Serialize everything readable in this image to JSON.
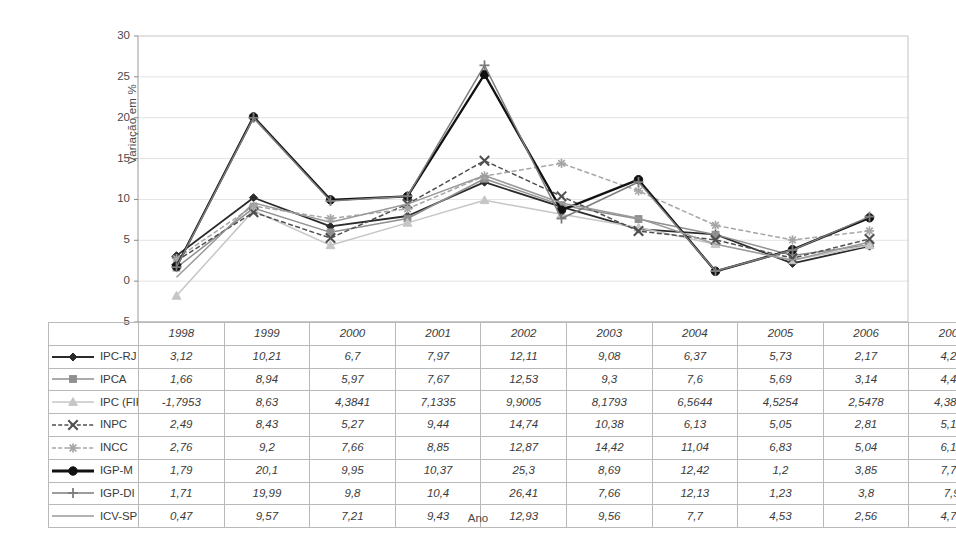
{
  "chart_data": {
    "type": "line",
    "title": "",
    "xlabel": "Ano",
    "ylabel": "Variação em %",
    "categories": [
      "1998",
      "1999",
      "2000",
      "2001",
      "2002",
      "2003",
      "2004",
      "2005",
      "2006",
      "2007"
    ],
    "ylim": [
      -5,
      30
    ],
    "yticks": [
      30,
      25,
      20,
      15,
      10,
      5,
      0,
      -5
    ],
    "grid": true,
    "legend_position": "table-below",
    "series": [
      {
        "name": "IPC-RJ",
        "marker": "diamond",
        "color": "#2b2b2b",
        "dash": "solid",
        "values": [
          3.12,
          10.21,
          6.7,
          7.97,
          12.11,
          9.08,
          6.37,
          5.73,
          2.17,
          4.28
        ],
        "labels": [
          "3,12",
          "10,21",
          "6,7",
          "7,97",
          "12,11",
          "9,08",
          "6,37",
          "5,73",
          "2,17",
          "4,28"
        ]
      },
      {
        "name": "IPCA",
        "marker": "square",
        "color": "#8f8f8f",
        "dash": "solid",
        "values": [
          1.66,
          8.94,
          5.97,
          7.67,
          12.53,
          9.3,
          7.6,
          5.69,
          3.14,
          4.46
        ],
        "labels": [
          "1,66",
          "8,94",
          "5,97",
          "7,67",
          "12,53",
          "9,3",
          "7,6",
          "5,69",
          "3,14",
          "4,46"
        ]
      },
      {
        "name": "IPC (FIPE)",
        "marker": "triangle",
        "color": "#c6c6c6",
        "dash": "solid",
        "values": [
          -1.7953,
          8.63,
          4.3841,
          7.1335,
          9.9005,
          8.1793,
          6.5644,
          4.5254,
          2.5478,
          4.3821
        ],
        "labels": [
          "-1,7953",
          "8,63",
          "4,3841",
          "7,1335",
          "9,9005",
          "8,1793",
          "6,5644",
          "4,5254",
          "2,5478",
          "4,3821"
        ]
      },
      {
        "name": "INPC",
        "marker": "x",
        "color": "#4f4f4f",
        "dash": "dashed",
        "values": [
          2.49,
          8.43,
          5.27,
          9.44,
          14.74,
          10.38,
          6.13,
          5.05,
          2.81,
          5.16
        ],
        "labels": [
          "2,49",
          "8,43",
          "5,27",
          "9,44",
          "14,74",
          "10,38",
          "6,13",
          "5,05",
          "2,81",
          "5,16"
        ]
      },
      {
        "name": "INCC",
        "marker": "star",
        "color": "#a6a6a6",
        "dash": "dashed",
        "values": [
          2.76,
          9.2,
          7.66,
          8.85,
          12.87,
          14.42,
          11.04,
          6.83,
          5.04,
          6.15
        ],
        "labels": [
          "2,76",
          "9,2",
          "7,66",
          "8,85",
          "12,87",
          "14,42",
          "11,04",
          "6,83",
          "5,04",
          "6,15"
        ]
      },
      {
        "name": "IGP-M",
        "marker": "circle",
        "color": "#111111",
        "dash": "solid",
        "values": [
          1.79,
          20.1,
          9.95,
          10.37,
          25.3,
          8.69,
          12.42,
          1.2,
          3.85,
          7.75
        ],
        "labels": [
          "1,79",
          "20,1",
          "9,95",
          "10,37",
          "25,3",
          "8,69",
          "12,42",
          "1,2",
          "3,85",
          "7,75"
        ]
      },
      {
        "name": "IGP-DI",
        "marker": "plus",
        "color": "#7d7d7d",
        "dash": "solid",
        "values": [
          1.71,
          19.99,
          9.8,
          10.4,
          26.41,
          7.66,
          12.13,
          1.23,
          3.8,
          7.9
        ],
        "labels": [
          "1,71",
          "19,99",
          "9,8",
          "10,4",
          "26,41",
          "7,66",
          "12,13",
          "1,23",
          "3,8",
          "7,9"
        ]
      },
      {
        "name": "ICV-SP",
        "marker": "none",
        "color": "#9a9a9a",
        "dash": "solid",
        "values": [
          0.47,
          9.57,
          7.21,
          9.43,
          12.93,
          9.56,
          7.7,
          4.53,
          2.56,
          4.79
        ],
        "labels": [
          "0,47",
          "9,57",
          "7,21",
          "9,43",
          "12,93",
          "9,56",
          "7,7",
          "4,53",
          "2,56",
          "4,79"
        ]
      }
    ]
  },
  "table": {
    "corner_label": "",
    "column_headers": [
      "1998",
      "1999",
      "2000",
      "2001",
      "2002",
      "2003",
      "2004",
      "2005",
      "2006",
      "2007"
    ]
  }
}
